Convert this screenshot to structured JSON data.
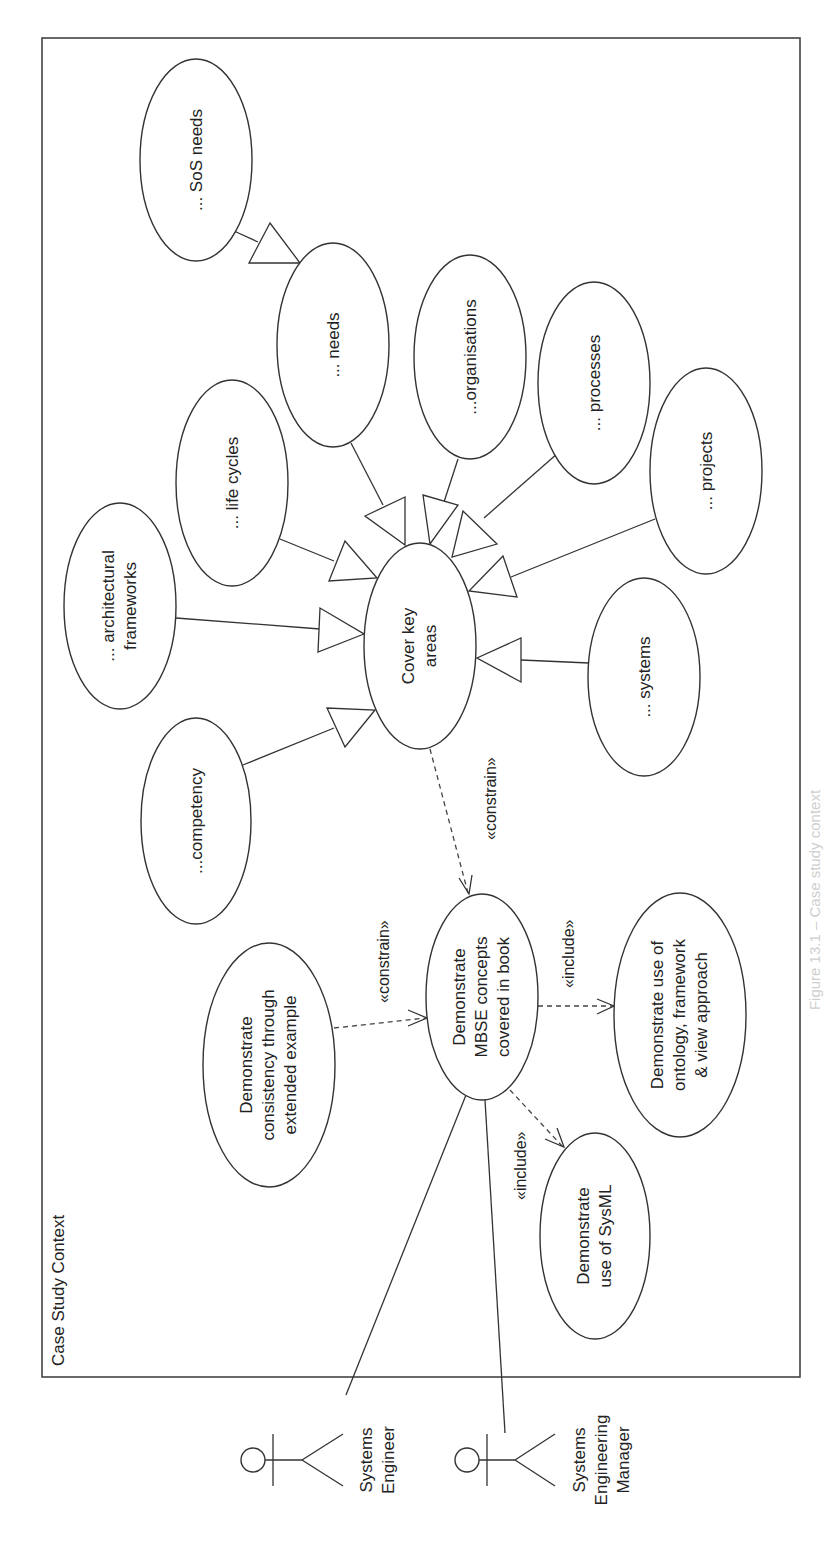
{
  "frame": {
    "title": "Case Study Context"
  },
  "use_cases": {
    "sos_needs": "... SoS needs",
    "needs": "... needs",
    "organisations": "...organisations",
    "life_cycles": "... life cycles",
    "processes": "... processes",
    "projects": "... projects",
    "architectural_frameworks": [
      "... architectural",
      "frameworks"
    ],
    "cover_key_areas": [
      "Cover key",
      "areas"
    ],
    "systems": "... systems",
    "competency": "...competency",
    "mbse_concepts": [
      "Demonstrate",
      "MBSE concepts",
      "covered in book"
    ],
    "consistency": [
      "Demonstrate",
      "consistency through",
      "extended example"
    ],
    "ontology": [
      "Demonstrate use of",
      "ontology, framework",
      "& view approach"
    ],
    "sysml": [
      "Demonstrate",
      "use of SysML"
    ]
  },
  "relationships": {
    "constrain_1": "«constrain»",
    "constrain_2": "«constrain»",
    "include_1": "«include»",
    "include_2": "«include»"
  },
  "actors": {
    "systems_engineer": [
      "Systems",
      "Engineer"
    ],
    "systems_engineering_manager": [
      "Systems",
      "Engineering",
      "Manager"
    ]
  },
  "caption": "Figure 13.1 – Case study context",
  "colors": {
    "line": "#333333",
    "background": "#ffffff"
  }
}
